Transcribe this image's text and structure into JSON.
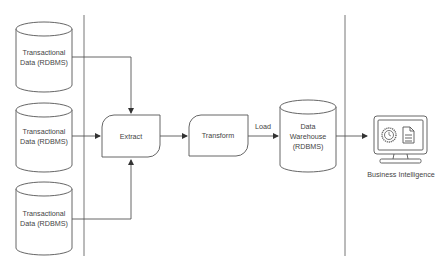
{
  "diagram": {
    "sources": [
      {
        "line1": "Transactional",
        "line2": "Data (RDBMS)"
      },
      {
        "line1": "Transactional",
        "line2": "Data (RDBMS)"
      },
      {
        "line1": "Transactional",
        "line2": "Data (RDBMS)"
      }
    ],
    "extract": {
      "label": "Extract"
    },
    "transform": {
      "label": "Transform"
    },
    "load": {
      "label": "Load"
    },
    "warehouse": {
      "line1": "Data",
      "line2": "Warehouse",
      "line3": "(RDBMS)"
    },
    "bi": {
      "label": "Business Intelligence"
    }
  },
  "colors": {
    "stroke": "#555555",
    "background": "#ffffff",
    "text": "#444444"
  }
}
